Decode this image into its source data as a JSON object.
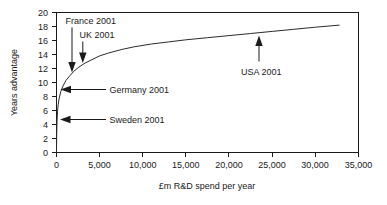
{
  "chart_data": {
    "type": "line",
    "title": "",
    "xlabel": "£m R&D spend per year",
    "ylabel": "Years advantage",
    "xlim": [
      0,
      35000
    ],
    "ylim": [
      0,
      20
    ],
    "grid": false,
    "legend": "none",
    "x_ticks": [
      "0",
      "5,000",
      "10,000",
      "15,000",
      "20,000",
      "25,000",
      "30,000",
      "35,000"
    ],
    "x_tick_values": [
      0,
      5000,
      10000,
      15000,
      20000,
      25000,
      30000,
      35000
    ],
    "y_ticks": [
      "0",
      "2",
      "4",
      "6",
      "8",
      "10",
      "12",
      "14",
      "16",
      "18",
      "20"
    ],
    "y_tick_values": [
      0,
      2,
      4,
      6,
      8,
      10,
      12,
      14,
      16,
      18,
      20
    ],
    "series": [
      {
        "name": "Years advantage vs R&D spend",
        "x": [
          0,
          20,
          60,
          120,
          200,
          320,
          500,
          750,
          1100,
          1500,
          2000,
          2600,
          3200,
          4000,
          5000,
          6000,
          7500,
          9000,
          11000,
          13000,
          15000,
          17500,
          20000,
          22500,
          25000,
          27500,
          30000,
          32800
        ],
        "values": [
          0,
          2.4,
          4.4,
          5.9,
          6.9,
          7.8,
          8.7,
          9.5,
          10.3,
          10.9,
          11.6,
          12.2,
          12.7,
          13.2,
          13.8,
          14.2,
          14.7,
          15.1,
          15.5,
          15.8,
          16.1,
          16.4,
          16.7,
          17.0,
          17.3,
          17.6,
          17.9,
          18.2
        ]
      }
    ],
    "annotations": [
      {
        "label": "France 2001",
        "point_x": 1800,
        "point_y": 11.5,
        "text_x": 1150,
        "text_y": 18.6,
        "direction": "down"
      },
      {
        "label": "UK 2001",
        "point_x": 3050,
        "point_y": 12.8,
        "text_x": 2700,
        "text_y": 16.6,
        "direction": "down"
      },
      {
        "label": "Germany 2001",
        "point_x": 330,
        "point_y": 9.0,
        "text_x": 4300,
        "text_y": 9.3,
        "direction": "left"
      },
      {
        "label": "Sweden 2001",
        "point_x": 130,
        "point_y": 4.7,
        "text_x": 4300,
        "text_y": 5.0,
        "direction": "left"
      },
      {
        "label": "USA 2001",
        "point_x": 23500,
        "point_y": 16.9,
        "text_x": 21500,
        "text_y": 12.6,
        "direction": "up"
      }
    ]
  }
}
